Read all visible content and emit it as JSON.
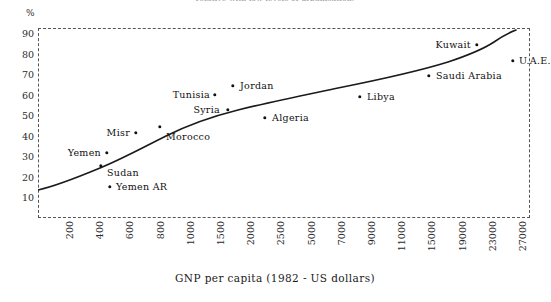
{
  "caption": "relative with low levels of urbanisation.",
  "axes": {
    "y_unit_label": "%",
    "y_ticks": [
      "90",
      "80",
      "70",
      "60",
      "50",
      "40",
      "30",
      "20",
      "10"
    ],
    "x_ticks": [
      "200",
      "400",
      "600",
      "800",
      "1000",
      "1500",
      "2000",
      "2500",
      "5000",
      "7000",
      "9000",
      "11000",
      "15000",
      "19000",
      "23000",
      "27000"
    ],
    "x_title": "GNP per capita (1982 - US dollars)"
  },
  "chart_data": {
    "type": "scatter",
    "title": "",
    "xlabel": "GNP per capita (1982 - US dollars)",
    "ylabel": "%",
    "grid": false,
    "legend": "none",
    "x_scale": "ordinal-log-like",
    "x_tick_labels": [
      "200",
      "400",
      "600",
      "800",
      "1000",
      "1500",
      "2000",
      "2500",
      "5000",
      "7000",
      "9000",
      "11000",
      "15000",
      "19000",
      "23000",
      "27000"
    ],
    "ylim": [
      0,
      95
    ],
    "y_tick_values": [
      10,
      20,
      30,
      40,
      50,
      60,
      70,
      80,
      90
    ],
    "points": [
      {
        "name": "Yemen",
        "gnp": 500,
        "value": 32,
        "px": 107,
        "py": 153,
        "label_side": "left",
        "label_dx": -6,
        "label_dy": 0
      },
      {
        "name": "Sudan",
        "gnp": 440,
        "value": 26,
        "px": 101,
        "py": 166,
        "label_side": "right",
        "label_dx": 6,
        "label_dy": 7
      },
      {
        "name": "Yemen AR",
        "gnp": 520,
        "value": 16,
        "px": 110,
        "py": 187,
        "label_side": "right",
        "label_dx": 6,
        "label_dy": 0
      },
      {
        "name": "Misr",
        "gnp": 690,
        "value": 43,
        "px": 136,
        "py": 133,
        "label_side": "left",
        "label_dx": -6,
        "label_dy": 0
      },
      {
        "name": "Morocco",
        "gnp": 870,
        "value": 46,
        "px": 160,
        "py": 127,
        "label_side": "right",
        "label_dx": 6,
        "label_dy": 10
      },
      {
        "name": "Tunisia",
        "gnp": 1390,
        "value": 54,
        "px": 215,
        "py": 95,
        "label_side": "left",
        "label_dx": -5,
        "label_dy": 0
      },
      {
        "name": "Syria",
        "gnp": 1550,
        "value": 51,
        "px": 228,
        "py": 110,
        "label_side": "left",
        "label_dx": -8,
        "label_dy": 0
      },
      {
        "name": "Jordan",
        "gnp": 1690,
        "value": 61,
        "px": 233,
        "py": 86,
        "label_side": "right",
        "label_dx": 7,
        "label_dy": 0
      },
      {
        "name": "Algeria",
        "gnp": 2400,
        "value": 48,
        "px": 265,
        "py": 118,
        "label_side": "right",
        "label_dx": 7,
        "label_dy": 0
      },
      {
        "name": "Libya",
        "gnp": 8500,
        "value": 59,
        "px": 360,
        "py": 97,
        "label_side": "right",
        "label_dx": 7,
        "label_dy": 0
      },
      {
        "name": "Saudi Arabia",
        "gnp": 15500,
        "value": 69,
        "px": 429,
        "py": 76,
        "label_side": "right",
        "label_dx": 7,
        "label_dy": 0
      },
      {
        "name": "Kuwait",
        "gnp": 21500,
        "value": 84,
        "px": 477,
        "py": 45,
        "label_side": "left",
        "label_dx": -6,
        "label_dy": 0
      },
      {
        "name": "U.A.E.",
        "gnp": 25500,
        "value": 77,
        "px": 513,
        "py": 61,
        "label_side": "right",
        "label_dx": 6,
        "label_dy": 0
      }
    ],
    "trend_curve_note": "smooth increasing fitted curve through the scatter",
    "colors": {
      "ink": "#111111",
      "frame": "#555555",
      "background": "#ffffff"
    }
  }
}
